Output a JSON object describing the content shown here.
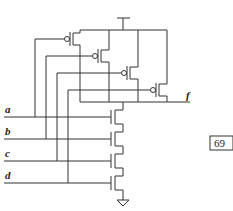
{
  "diagram": {
    "type": "CMOS NAND4 gate schematic",
    "inputs": [
      {
        "name": "a",
        "label": "a"
      },
      {
        "name": "b",
        "label": "b"
      },
      {
        "name": "c",
        "label": "c"
      },
      {
        "name": "d",
        "label": "d"
      }
    ],
    "output": {
      "name": "f",
      "label": "f"
    },
    "page_number": "69",
    "supply": "VDD",
    "ground": "GND",
    "pmos_count": 4,
    "nmos_count": 4
  }
}
